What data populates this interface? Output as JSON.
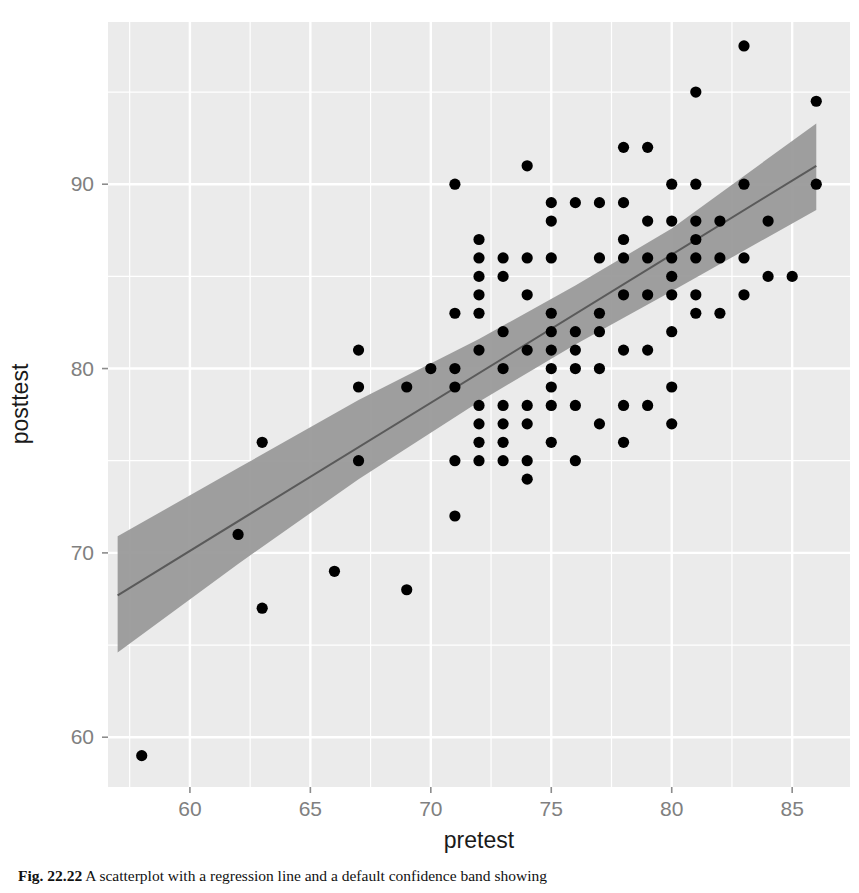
{
  "figure": {
    "caption_label": "Fig. 22.22",
    "caption_text": "A scatterplot with a regression line and a default confidence band showing",
    "panel_bg": "#ebebeb",
    "grid_color": "#ffffff",
    "point_color": "#000000",
    "line_color": "#5a5a5a",
    "band_color": "#9a9a9a"
  },
  "chart_data": {
    "type": "scatter",
    "title": "",
    "xlabel": "pretest",
    "ylabel": "posttest",
    "xlim": [
      56.6,
      87.4
    ],
    "ylim": [
      57.3,
      98.8
    ],
    "xticks": [
      60,
      65,
      70,
      75,
      80,
      85
    ],
    "yticks": [
      60,
      70,
      80,
      90
    ],
    "grid": true,
    "legend": "none",
    "x": [
      58,
      62,
      63,
      63,
      66,
      67,
      67,
      67,
      69,
      69,
      70,
      71,
      71,
      71,
      71,
      71,
      71,
      72,
      72,
      72,
      72,
      72,
      72,
      72,
      72,
      72,
      72,
      73,
      73,
      73,
      73,
      73,
      73,
      73,
      73,
      74,
      74,
      74,
      74,
      74,
      74,
      74,
      74,
      75,
      75,
      75,
      75,
      75,
      75,
      75,
      75,
      75,
      75,
      76,
      76,
      76,
      76,
      76,
      76,
      77,
      77,
      77,
      77,
      77,
      77,
      78,
      78,
      78,
      78,
      78,
      78,
      78,
      78,
      79,
      79,
      79,
      79,
      79,
      79,
      80,
      80,
      80,
      80,
      80,
      80,
      80,
      80,
      81,
      81,
      81,
      81,
      81,
      81,
      81,
      82,
      82,
      82,
      83,
      83,
      83,
      83,
      84,
      84,
      85,
      86,
      86
    ],
    "y": [
      59,
      71,
      67,
      76,
      69,
      75,
      79,
      81,
      68,
      79,
      80,
      72,
      75,
      79,
      80,
      83,
      90,
      75,
      76,
      77,
      78,
      81,
      83,
      84,
      85,
      86,
      87,
      75,
      76,
      77,
      78,
      80,
      82,
      85,
      86,
      74,
      75,
      77,
      78,
      81,
      84,
      86,
      91,
      76,
      78,
      79,
      80,
      81,
      82,
      83,
      86,
      88,
      89,
      75,
      78,
      80,
      81,
      82,
      89,
      77,
      80,
      82,
      83,
      86,
      89,
      76,
      78,
      81,
      84,
      86,
      87,
      89,
      92,
      78,
      81,
      84,
      86,
      88,
      92,
      77,
      79,
      82,
      84,
      85,
      86,
      88,
      90,
      83,
      84,
      86,
      87,
      88,
      90,
      95,
      83,
      86,
      88,
      84,
      86,
      90,
      97.5,
      85,
      88,
      85,
      90,
      94.5
    ],
    "fit_line": {
      "x": [
        57.0,
        86.0
      ],
      "y": [
        67.7,
        91.0
      ],
      "description": "linear regression line"
    },
    "confidence_band": {
      "x": [
        57.0,
        62.0,
        67.0,
        72.0,
        76.0,
        80.0,
        86.0
      ],
      "ymin": [
        64.6,
        69.4,
        74.0,
        78.2,
        81.3,
        84.2,
        88.6
      ],
      "ymax": [
        70.9,
        74.6,
        78.3,
        81.6,
        84.5,
        87.6,
        93.3
      ],
      "level": 0.95
    }
  }
}
